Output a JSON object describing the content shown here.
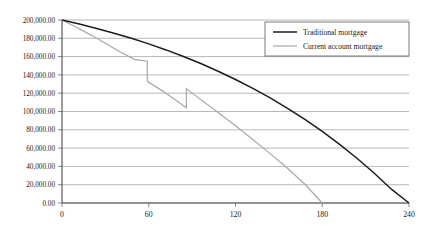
{
  "chart_data": {
    "type": "line",
    "title": "",
    "xlabel": "",
    "ylabel": "",
    "xlim": [
      0,
      240
    ],
    "ylim": [
      0,
      200000
    ],
    "grid": true,
    "legend_position": "top-right",
    "x_ticks": [
      "0",
      "60",
      "120",
      "180",
      "240"
    ],
    "x_tick_values": [
      0,
      60,
      120,
      180,
      240
    ],
    "y_ticks": [
      "0.00",
      "20,000.00",
      "40,000.00",
      "60,000.00",
      "80,000.00",
      "100,000.00",
      "120,000.00",
      "140,000.00",
      "160,000.00",
      "180,000.00",
      "200,000.00"
    ],
    "y_tick_values": [
      0,
      20000,
      40000,
      60000,
      80000,
      100000,
      120000,
      140000,
      160000,
      180000,
      200000
    ],
    "series": [
      {
        "name": "Traditional mortgage",
        "color": "#1c1c1c",
        "x": [
          0,
          12,
          24,
          36,
          48,
          60,
          72,
          84,
          96,
          108,
          120,
          132,
          144,
          156,
          168,
          180,
          192,
          204,
          216,
          228,
          240
        ],
        "values": [
          200000,
          195600,
          190800,
          185600,
          180000,
          173900,
          167300,
          160100,
          152400,
          144000,
          135000,
          125300,
          114800,
          103500,
          91300,
          78200,
          64100,
          48900,
          32500,
          14800,
          0
        ]
      },
      {
        "name": "Current account mortgage",
        "color": "#a8a8a8",
        "x": [
          0,
          10,
          20,
          30,
          40,
          50,
          59,
          59,
          70,
          80,
          86,
          86,
          96,
          108,
          120,
          132,
          144,
          156,
          168,
          180
        ],
        "values": [
          200000,
          192000,
          183500,
          174500,
          165200,
          157000,
          155000,
          133000,
          122000,
          111000,
          104000,
          125000,
          113000,
          99000,
          84500,
          69500,
          54000,
          38000,
          20500,
          0
        ],
        "step_annotations": [
          {
            "x": 59,
            "from": 155000,
            "to": 133000,
            "kind": "drop"
          },
          {
            "x": 86,
            "from": 104000,
            "to": 125000,
            "kind": "rise"
          }
        ]
      }
    ]
  },
  "legend": {
    "items": [
      {
        "label": "Traditional mortgage",
        "color": "#1c1c1c"
      },
      {
        "label": "Current account mortgage",
        "color": "#a8a8a8"
      }
    ]
  },
  "colors": {
    "traditional": "#1c1c1c",
    "current": "#a8a8a8",
    "grid": "#9a9a9a",
    "axis": "#4a4a4a",
    "background": "#ffffff"
  }
}
